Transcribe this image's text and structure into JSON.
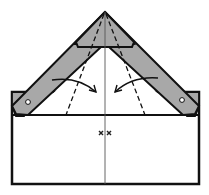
{
  "diagram": {
    "type": "origami-fold-step",
    "colors": {
      "paper": "#ffffff",
      "folded_layer": "#a8a8a8",
      "outline": "#111111",
      "crease": "#555555"
    },
    "elements": {
      "arrows": [
        {
          "id": "left-arrow",
          "direction": "fold-inward-right"
        },
        {
          "id": "right-arrow",
          "direction": "fold-inward-left"
        }
      ],
      "marks": [
        "x",
        "x"
      ],
      "dashed_lines": 4,
      "pivot_dots": 2
    },
    "marks_label": "× ×"
  }
}
